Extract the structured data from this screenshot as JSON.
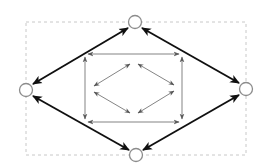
{
  "figure": {
    "width": 269,
    "height": 165,
    "background_color": "#ffffff"
  },
  "bounding_box": {
    "label": "dashed-bounding-box",
    "x": 26,
    "y": 22,
    "width": 220,
    "height": 133,
    "stroke_color": "#c8c8c8",
    "dash": "3,3",
    "stroke_width": 1
  },
  "nodes": [
    {
      "id": "top",
      "label": "node-top",
      "cx": 135,
      "cy": 22,
      "r": 6.5,
      "stroke_color": "#8c8c8c",
      "fill_color": "#ffffff",
      "stroke_width": 1.3
    },
    {
      "id": "left",
      "label": "node-left",
      "cx": 26,
      "cy": 90,
      "r": 6.5,
      "stroke_color": "#8c8c8c",
      "fill_color": "#ffffff",
      "stroke_width": 1.3
    },
    {
      "id": "right",
      "label": "node-right",
      "cx": 246,
      "cy": 89,
      "r": 6.5,
      "stroke_color": "#8c8c8c",
      "fill_color": "#ffffff",
      "stroke_width": 1.3
    },
    {
      "id": "bottom",
      "label": "node-bottom",
      "cx": 136,
      "cy": 155,
      "r": 6.5,
      "stroke_color": "#8c8c8c",
      "fill_color": "#ffffff",
      "stroke_width": 1.3
    }
  ],
  "outer_diamond": {
    "label": "outer-diamond-bidirectional-edges",
    "stroke_color": "#101010",
    "stroke_width": 1.9,
    "arrow_style": "double-headed-solid",
    "edges": [
      {
        "id": "outer-top-left",
        "from": "left",
        "to": "top",
        "x1": 33,
        "y1": 84,
        "x2": 128,
        "y2": 28
      },
      {
        "id": "outer-top-right",
        "from": "top",
        "to": "right",
        "x1": 142,
        "y1": 28,
        "x2": 239,
        "y2": 83
      },
      {
        "id": "outer-bottom-left",
        "from": "left",
        "to": "bottom",
        "x1": 33,
        "y1": 96,
        "x2": 129,
        "y2": 150
      },
      {
        "id": "outer-bottom-right",
        "from": "bottom",
        "to": "right",
        "x1": 143,
        "y1": 150,
        "x2": 239,
        "y2": 95
      }
    ]
  },
  "inner_rectangle": {
    "label": "inner-rectangle-bidirectional-edges",
    "stroke_color": "#6e6e6e",
    "stroke_width": 0.85,
    "arrow_style": "double-headed-thin",
    "x1": 85,
    "y1": 54,
    "x2": 182,
    "y2": 122,
    "edges": [
      {
        "id": "rect-top",
        "x1": 88,
        "y1": 54,
        "x2": 179,
        "y2": 54
      },
      {
        "id": "rect-bottom",
        "x1": 88,
        "y1": 122,
        "x2": 179,
        "y2": 122
      },
      {
        "id": "rect-left",
        "x1": 85,
        "y1": 57,
        "x2": 85,
        "y2": 119
      },
      {
        "id": "rect-right",
        "x1": 182,
        "y1": 57,
        "x2": 182,
        "y2": 119
      }
    ]
  },
  "inner_diamond": {
    "label": "innermost-diamond-bidirectional-edges",
    "stroke_color": "#6e6e6e",
    "stroke_width": 0.85,
    "arrow_style": "double-headed-thin",
    "vertices": {
      "top": {
        "x": 134,
        "y": 61
      },
      "left": {
        "x": 90,
        "y": 89
      },
      "right": {
        "x": 178,
        "y": 88
      },
      "bottom": {
        "x": 134,
        "y": 116
      }
    },
    "edges": [
      {
        "id": "diamond-top-left",
        "x1": 94,
        "y1": 86,
        "x2": 130,
        "y2": 64
      },
      {
        "id": "diamond-top-right",
        "x1": 138,
        "y1": 64,
        "x2": 174,
        "y2": 85
      },
      {
        "id": "diamond-bottom-left",
        "x1": 94,
        "y1": 92,
        "x2": 130,
        "y2": 113
      },
      {
        "id": "diamond-bottom-right",
        "x1": 138,
        "y1": 113,
        "x2": 174,
        "y2": 91
      }
    ]
  }
}
